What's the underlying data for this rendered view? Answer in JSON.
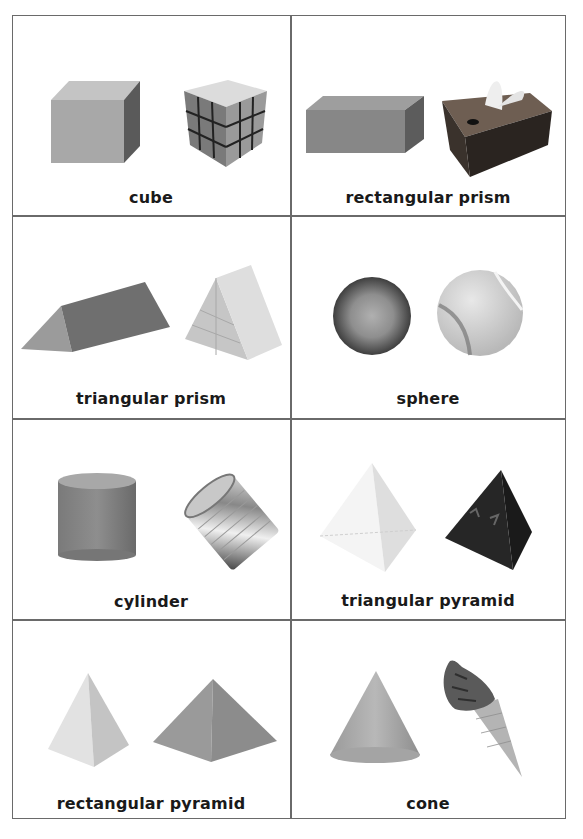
{
  "cards": [
    {
      "label": "cube",
      "shape": "cube",
      "example": "rubiks-cube"
    },
    {
      "label": "rectangular prism",
      "shape": "rectangular-prism",
      "example": "tissue-box"
    },
    {
      "label": "triangular prism",
      "shape": "triangular-prism",
      "example": "wooden-triangular-block"
    },
    {
      "label": "sphere",
      "shape": "sphere",
      "example": "tennis-ball"
    },
    {
      "label": "cylinder",
      "shape": "cylinder",
      "example": "tin-can"
    },
    {
      "label": "triangular pyramid",
      "shape": "triangular-pyramid",
      "example": "four-sided-die"
    },
    {
      "label": "rectangular pyramid",
      "shape": "rectangular-pyramid",
      "example": "stone-pyramid"
    },
    {
      "label": "cone",
      "shape": "cone",
      "example": "ice-cream-cone"
    }
  ],
  "colors": {
    "border": "#6a6a6a",
    "text": "#1a1a1a",
    "shape_fill": "#8c8c8c"
  }
}
